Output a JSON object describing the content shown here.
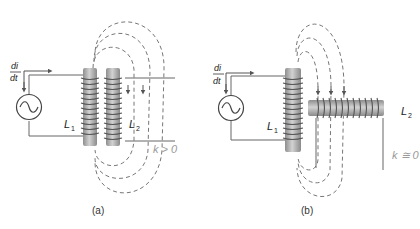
{
  "panels": [
    {
      "id": "a",
      "caption": "(a)",
      "source_label_num": "di",
      "source_label_den": "dt",
      "coil1_label": "L",
      "coil1_sub": "1",
      "coil2_label": "L",
      "coil2_sub": "2",
      "coupling_label": "k > 0",
      "description": "Two parallel vertical coils side by side; flux lines of L1 pass through L2"
    },
    {
      "id": "b",
      "caption": "(b)",
      "source_label_num": "di",
      "source_label_den": "dt",
      "coil1_label": "L",
      "coil1_sub": "1",
      "coil2_label": "L",
      "coil2_sub": "2",
      "coupling_label": "k ≅ 0",
      "description": "Vertical coil L1 with horizontal coil L2 perpendicular; flux lines cut across L2"
    }
  ],
  "colors": {
    "core": "#a8a8a8",
    "core_highlight": "#d0d0d0",
    "wire": "#666666",
    "flux": "#777777",
    "k_label": "#9a9a9a"
  },
  "icons": [
    "ac-source-icon",
    "current-arrow-icon"
  ]
}
